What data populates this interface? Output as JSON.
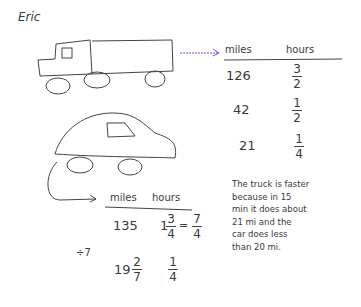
{
  "student_name": "Eric",
  "truck_table": {
    "headers": [
      "miles",
      "hours"
    ],
    "rows": [
      {
        "miles": "126",
        "hours_num": "3",
        "hours_den": "2"
      },
      {
        "miles": "42",
        "hours_num": "1",
        "hours_den": "2"
      },
      {
        "miles": "21",
        "hours_num": "1",
        "hours_den": "4"
      }
    ]
  },
  "car_table": {
    "headers": [
      "miles",
      "hours"
    ],
    "rows": [
      {
        "miles": "135",
        "hours_whole": "1",
        "hours_num": "3",
        "hours_den": "4",
        "equals": "=",
        "improper_num": "7",
        "improper_den": "4"
      },
      {
        "miles_whole": "19",
        "miles_num": "2",
        "miles_den": "7",
        "hours_num": "1",
        "hours_den": "4"
      }
    ],
    "operation": "÷7"
  },
  "explanation": "The truck is faster\nbecause in 15\nmin it does about\n21 mi and the\ncar does less\nthan 20 mi.",
  "drawings": [
    "truck-drawing",
    "car-drawing",
    "blue-arrow",
    "curved-arrow"
  ],
  "colors": {
    "ink": "#3a3a3a",
    "arrow_blue": "#5a5ad0"
  }
}
